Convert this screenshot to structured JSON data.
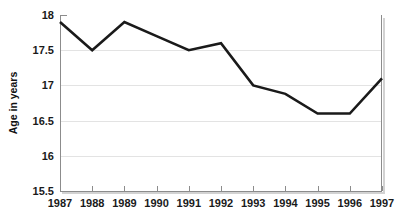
{
  "chart_data": {
    "type": "line",
    "title": "",
    "subtitle": "",
    "xlabel": "",
    "ylabel": "Age in years",
    "x": [
      1987,
      1988,
      1989,
      1990,
      1991,
      1992,
      1993,
      1994,
      1995,
      1996,
      1997
    ],
    "categories": [
      "1987",
      "1988",
      "1989",
      "1990",
      "1991",
      "1992",
      "1993",
      "1994",
      "1995",
      "1996",
      "1997"
    ],
    "values": [
      17.9,
      17.5,
      17.9,
      17.7,
      17.5,
      17.6,
      17.0,
      16.88,
      16.6,
      16.6,
      17.1
    ],
    "series": [
      {
        "name": "Age in years",
        "values": [
          17.9,
          17.5,
          17.9,
          17.7,
          17.5,
          17.6,
          17.0,
          16.88,
          16.6,
          16.6,
          17.1
        ],
        "color": "#1a1a1a"
      }
    ],
    "ylim": [
      15.5,
      18.0
    ],
    "xlim": [
      1987,
      1997
    ],
    "yticks": [
      15.5,
      16.0,
      16.5,
      17.0,
      17.5,
      18.0
    ],
    "ytick_labels": [
      "15.5",
      "16",
      "16.5",
      "17",
      "17.5",
      "18"
    ],
    "xticks": [
      1987,
      1988,
      1989,
      1990,
      1991,
      1992,
      1993,
      1994,
      1995,
      1996,
      1997
    ],
    "xtick_labels": [
      "1987",
      "1988",
      "1989",
      "1990",
      "1991",
      "1992",
      "1993",
      "1994",
      "1995",
      "1996",
      "1997"
    ],
    "grid": "horizontal",
    "legend": "none",
    "annotations": []
  },
  "colors": {
    "line": "#1a1a1a",
    "gridline": "#e3e3e3",
    "axis": "#8c8c8c",
    "axis_shadow": "#d2d2d2",
    "text": "#1a1a1a",
    "background": "#ffffff"
  },
  "layout": {
    "plot_left": 60,
    "plot_right": 382,
    "plot_top": 15,
    "plot_bottom": 191
  }
}
